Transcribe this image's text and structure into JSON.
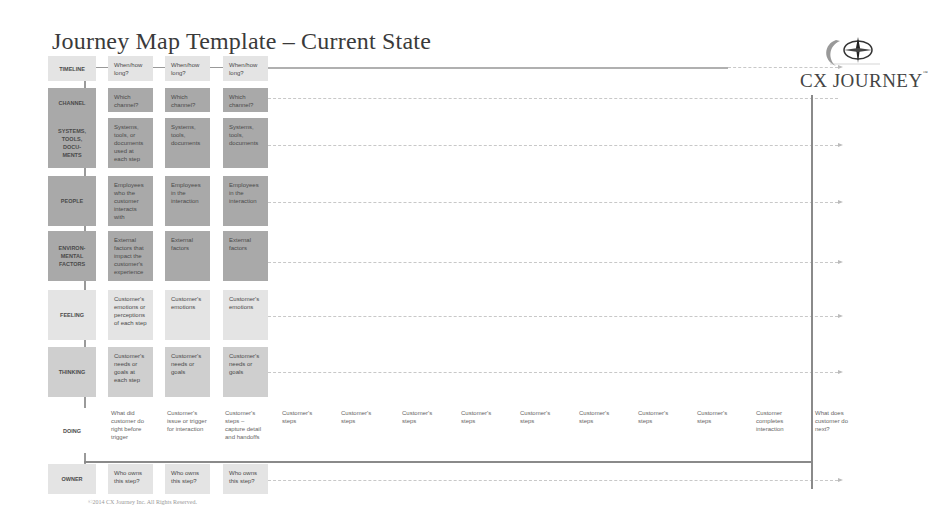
{
  "title": "Journey Map Template – Current State",
  "logo": {
    "text": "CX JOURNEY",
    "trademark": "™",
    "icon": "compass-icon"
  },
  "footer": "©2014 CX Journey Inc. All Rights Reserved.",
  "colors": {
    "light": "#e4e4e4",
    "mid": "#cfcfcf",
    "dark": "#a9a9a9",
    "line": "#9a9a9a"
  },
  "rows": [
    {
      "label": "TIMELINE",
      "shade": "light",
      "cells": [
        "When/how long?",
        "When/how long?",
        "When/how long?"
      ]
    },
    {
      "label": "CHANNEL",
      "shade": "dark",
      "cells": [
        "Which channel?",
        "Which channel?",
        "Which channel?"
      ]
    },
    {
      "label": "SYSTEMS, TOOLS, DOCU-MENTS",
      "shade": "dark",
      "cells": [
        "Systems, tools, or documents used at each step",
        "Systems, tools, documents",
        "Systems, tools, documents"
      ]
    },
    {
      "label": "PEOPLE",
      "shade": "dark",
      "cells": [
        "Employees who the customer interacts with",
        "Employees in the interaction",
        "Employees in the interaction"
      ]
    },
    {
      "label": "ENVIRON-MENTAL FACTORS",
      "shade": "dark",
      "cells": [
        "External factors that impact the customer's experience",
        "External factors",
        "External factors"
      ]
    },
    {
      "label": "FEELING",
      "shade": "light",
      "cells": [
        "Customer's emotions or perceptions of each step",
        "Customer's emotions",
        "Customer's emotions"
      ]
    },
    {
      "label": "THINKING",
      "shade": "mid",
      "cells": [
        "Customer's needs or goals at each step",
        "Customer's needs or goals",
        "Customer's needs or goals"
      ]
    }
  ],
  "doing": {
    "label": "DOING",
    "cells": [
      "What did customer do right before trigger",
      "Customer's issue or trigger for interaction",
      "Customer's steps – capture detail and handoffs",
      "Customer's steps",
      "Customer's steps",
      "Customer's steps",
      "Customer's steps",
      "Customer's steps",
      "Customer's steps",
      "Customer's steps",
      "Customer's steps",
      "Customer completes interaction",
      "What does customer do next?"
    ]
  },
  "owner": {
    "label": "OWNER",
    "cells": [
      "Who owns this step?",
      "Who owns this step?",
      "Who owns this step?"
    ]
  }
}
